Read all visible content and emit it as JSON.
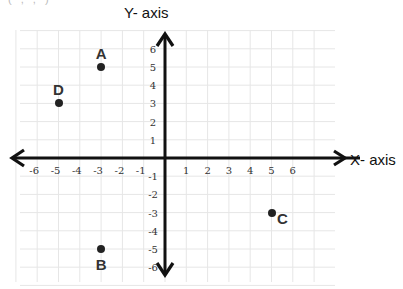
{
  "header_fragment": "( , , )",
  "chart_data": {
    "type": "scatter",
    "title": "",
    "xlabel": "X- axis",
    "ylabel": "Y- axis",
    "xlim": [
      -6,
      6
    ],
    "ylim": [
      -6,
      6
    ],
    "grid": true,
    "x_ticks": [
      "-6",
      "-5",
      "-4",
      "-3",
      "-2",
      "-1",
      "1",
      "2",
      "3",
      "4",
      "5",
      "6"
    ],
    "y_ticks": [
      "6",
      "5",
      "4",
      "3",
      "2",
      "1",
      "-1",
      "-2",
      "-3",
      "-4",
      "-5",
      "-6"
    ],
    "points": [
      {
        "label": "A",
        "x": -3,
        "y": 5
      },
      {
        "label": "B",
        "x": -3,
        "y": -5
      },
      {
        "label": "C",
        "x": 5,
        "y": -3
      },
      {
        "label": "D",
        "x": -5,
        "y": 3
      }
    ],
    "colors": {
      "axis": "#111111",
      "grid": "#e6e6e6",
      "point": "#222222",
      "label": "#333333"
    }
  }
}
